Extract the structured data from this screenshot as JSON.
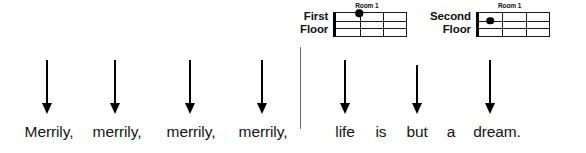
{
  "figure": {
    "divider": {
      "x": 300,
      "y": 47,
      "height": 82,
      "color": "#6a6a6a"
    }
  },
  "diagrams": [
    {
      "floor_label": "First\nFloor",
      "room_label": "Room 1",
      "room_label_x": 22,
      "left": 300,
      "top": 3,
      "grid": {
        "cols": 3,
        "rows": 3
      },
      "dot": {
        "x_pct": 33,
        "y_pct": 0
      }
    },
    {
      "floor_label": "Second\nFloor",
      "room_label": "Room 1",
      "room_label_x": 22,
      "left": 430,
      "top": 3,
      "grid": {
        "cols": 3,
        "rows": 3
      },
      "dot": {
        "x_pct": 16,
        "y_pct": 33
      }
    }
  ],
  "arrows": [
    {
      "x": 47,
      "top": 60,
      "shaft": 43,
      "points_to": "Merrily,"
    },
    {
      "x": 115,
      "top": 60,
      "shaft": 43,
      "points_to": "merrily,"
    },
    {
      "x": 190,
      "top": 60,
      "shaft": 43,
      "points_to": "merrily,"
    },
    {
      "x": 262,
      "top": 60,
      "shaft": 43,
      "points_to": "merrily,"
    },
    {
      "x": 345,
      "top": 60,
      "shaft": 43,
      "points_to": "life"
    },
    {
      "x": 417,
      "top": 65,
      "shaft": 38,
      "points_to": "but"
    },
    {
      "x": 490,
      "top": 60,
      "shaft": 43,
      "points_to": "dream."
    }
  ],
  "lyrics": [
    {
      "text": "Merrily,",
      "x": 49,
      "y": 123
    },
    {
      "text": "merrily,",
      "x": 117,
      "y": 123
    },
    {
      "text": "merrily,",
      "x": 191,
      "y": 123
    },
    {
      "text": "merrily,",
      "x": 263,
      "y": 123
    },
    {
      "text": "life",
      "x": 345,
      "y": 123
    },
    {
      "text": "is",
      "x": 381,
      "y": 123
    },
    {
      "text": "but",
      "x": 417,
      "y": 123
    },
    {
      "text": "a",
      "x": 451,
      "y": 123
    },
    {
      "text": "dream.",
      "x": 497,
      "y": 123
    }
  ],
  "colors": {
    "ink": "#111111",
    "grid_line": "#1a1a1a",
    "nut": "#000000",
    "divider": "#6a6a6a",
    "background": "#ffffff"
  }
}
